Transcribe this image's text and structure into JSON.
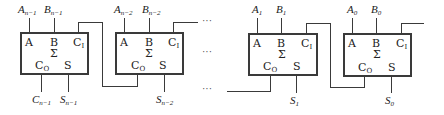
{
  "diagram": {
    "type": "ripple-carry adder (cascaded full adders)",
    "stroke_color": "#3a3a3a",
    "adders": [
      {
        "id": "adder-n-1",
        "ports": {
          "a": "A",
          "b": "B",
          "ci": "C",
          "ci_sub": "I",
          "sigma": "Σ",
          "co": "C",
          "co_sub": "O",
          "s": "S"
        },
        "inputs": {
          "a_main": "A",
          "a_sub": "n−1",
          "b_main": "B",
          "b_sub": "n−1"
        },
        "outputs": {
          "co_main": "C",
          "co_sub": "n−1",
          "s_main": "S",
          "s_sub": "n−1"
        }
      },
      {
        "id": "adder-n-2",
        "ports": {
          "a": "A",
          "b": "B",
          "ci": "C",
          "ci_sub": "I",
          "sigma": "Σ",
          "co": "C",
          "co_sub": "O",
          "s": "S"
        },
        "inputs": {
          "a_main": "A",
          "a_sub": "n−2",
          "b_main": "B",
          "b_sub": "n−2"
        },
        "outputs": {
          "s_main": "S",
          "s_sub": "n−2"
        }
      },
      {
        "id": "adder-1",
        "ports": {
          "a": "A",
          "b": "B",
          "ci": "C",
          "ci_sub": "I",
          "sigma": "Σ",
          "co": "C",
          "co_sub": "O",
          "s": "S"
        },
        "inputs": {
          "a_main": "A",
          "a_sub": "1",
          "b_main": "B",
          "b_sub": "1"
        },
        "outputs": {
          "s_main": "S",
          "s_sub": "1"
        }
      },
      {
        "id": "adder-0",
        "ports": {
          "a": "A",
          "b": "B",
          "ci": "C",
          "ci_sub": "I",
          "sigma": "Σ",
          "co": "C",
          "co_sub": "O",
          "s": "S"
        },
        "inputs": {
          "a_main": "A",
          "a_sub": "0",
          "b_main": "B",
          "b_sub": "0"
        },
        "outputs": {
          "s_main": "S",
          "s_sub": "0"
        }
      }
    ],
    "ellipsis": "···"
  }
}
